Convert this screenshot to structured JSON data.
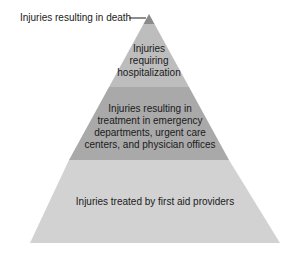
{
  "diagram": {
    "type": "pyramid",
    "tiers": [
      {
        "id": "death",
        "label": "Injuries resulting in death",
        "color": "#8a8a8a"
      },
      {
        "id": "hospitalization",
        "label": "Injuries requiring hospitalization",
        "lines": [
          "Injuries",
          "requiring",
          "hospitalization"
        ],
        "color": "#bdbdbd"
      },
      {
        "id": "emergency",
        "label": "Injuries resulting in treatment in emergency departments, urgent care centers, and physician offices",
        "lines": [
          "Injuries resulting in",
          "treatment in emergency",
          "departments, urgent care",
          "centers, and physician offices"
        ],
        "color": "#a9a9a9"
      },
      {
        "id": "first_aid",
        "label": "Injuries treated by first aid providers",
        "color": "#d2d2d2"
      }
    ]
  }
}
